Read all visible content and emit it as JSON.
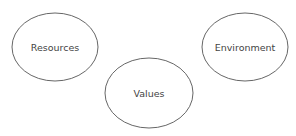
{
  "diagram": {
    "type": "concept-nodes",
    "nodes": [
      {
        "id": "resources",
        "label": "Resources",
        "cx": 55,
        "cy": 47,
        "rx": 43,
        "ry": 34
      },
      {
        "id": "values",
        "label": "Values",
        "cx": 149,
        "cy": 93,
        "rx": 44,
        "ry": 35
      },
      {
        "id": "environment",
        "label": "Environment",
        "cx": 245,
        "cy": 47,
        "rx": 43,
        "ry": 34
      }
    ],
    "colors": {
      "stroke": "#555555",
      "text": "#444444",
      "background": "#ffffff"
    }
  }
}
